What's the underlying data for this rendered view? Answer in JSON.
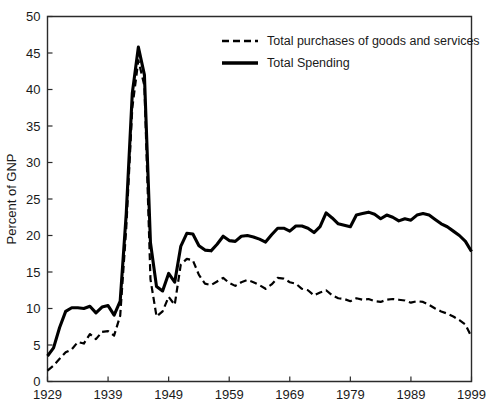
{
  "chart_data": {
    "type": "line",
    "title": "",
    "xlabel": "",
    "ylabel": "Percent of GNP",
    "xlim": [
      1929,
      1999
    ],
    "ylim": [
      0,
      50
    ],
    "grid": false,
    "legend_position": "top-right",
    "xticks": [
      1929,
      1939,
      1949,
      1959,
      1969,
      1979,
      1989,
      1999
    ],
    "yticks": [
      0,
      5,
      10,
      15,
      20,
      25,
      30,
      35,
      40,
      45,
      50
    ],
    "x": [
      1929,
      1930,
      1931,
      1932,
      1933,
      1934,
      1935,
      1936,
      1937,
      1938,
      1939,
      1940,
      1941,
      1942,
      1943,
      1944,
      1945,
      1946,
      1947,
      1948,
      1949,
      1950,
      1951,
      1952,
      1953,
      1954,
      1955,
      1956,
      1957,
      1958,
      1959,
      1960,
      1961,
      1962,
      1963,
      1964,
      1965,
      1966,
      1967,
      1968,
      1969,
      1970,
      1971,
      1972,
      1973,
      1974,
      1975,
      1976,
      1977,
      1978,
      1979,
      1980,
      1981,
      1982,
      1983,
      1984,
      1985,
      1986,
      1987,
      1988,
      1989,
      1990,
      1991,
      1992,
      1993,
      1994,
      1995,
      1996,
      1997,
      1998,
      1999
    ],
    "series": [
      {
        "name": "Total Spending",
        "style": "solid",
        "values": [
          3.5,
          4.6,
          7.4,
          9.6,
          10.1,
          10.1,
          10.0,
          10.3,
          9.4,
          10.2,
          10.4,
          9.1,
          11.0,
          23.0,
          39.5,
          45.8,
          42.0,
          19.0,
          13.0,
          12.4,
          14.8,
          13.6,
          18.5,
          20.3,
          20.2,
          18.6,
          18.0,
          17.9,
          18.8,
          19.9,
          19.3,
          19.2,
          19.9,
          20.0,
          19.8,
          19.5,
          19.1,
          20.1,
          21.0,
          21.0,
          20.6,
          21.3,
          21.3,
          21.0,
          20.4,
          21.2,
          23.1,
          22.4,
          21.6,
          21.4,
          21.2,
          22.8,
          23.0,
          23.2,
          22.9,
          22.3,
          22.8,
          22.5,
          22.0,
          22.3,
          22.1,
          22.8,
          23.0,
          22.8,
          22.2,
          21.6,
          21.2,
          20.6,
          20.0,
          19.2,
          17.8
        ]
      },
      {
        "name": "Total purchases of goods and services",
        "style": "dashed",
        "values": [
          1.5,
          2.2,
          3.1,
          4.0,
          4.4,
          5.4,
          5.2,
          6.5,
          5.8,
          6.8,
          6.9,
          6.3,
          9.0,
          21.0,
          37.5,
          44.0,
          40.5,
          14.0,
          8.9,
          9.6,
          11.6,
          10.5,
          16.0,
          16.8,
          16.6,
          14.6,
          13.4,
          13.2,
          13.7,
          14.2,
          13.5,
          13.1,
          13.6,
          13.9,
          13.6,
          13.2,
          12.7,
          13.3,
          14.2,
          14.1,
          13.6,
          13.4,
          12.7,
          12.5,
          11.8,
          12.2,
          12.5,
          11.8,
          11.4,
          11.3,
          11.0,
          11.4,
          11.2,
          11.3,
          11.0,
          10.9,
          11.2,
          11.3,
          11.2,
          11.1,
          10.8,
          11.0,
          10.9,
          10.5,
          10.0,
          9.6,
          9.3,
          8.9,
          8.4,
          7.8,
          6.1
        ]
      }
    ],
    "legend": [
      {
        "label": "Total purchases of goods and services",
        "style": "dashed"
      },
      {
        "label": "Total Spending",
        "style": "solid"
      }
    ],
    "colors": {
      "line": "#000000",
      "axis": "#2b2b2b",
      "background": "#ffffff"
    }
  }
}
